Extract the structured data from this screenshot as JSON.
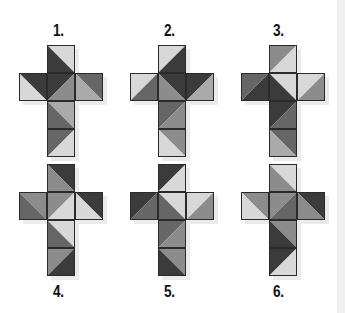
{
  "puzzle": {
    "shades": {
      "L": "#d8d8d8",
      "ML": "#aaaaaa",
      "M": "#8c8c8c",
      "MD": "#666666",
      "D": "#3b3b3b"
    },
    "nets": [
      {
        "label": "1.",
        "cells": [
          {
            "pos": "top",
            "diag": "tl-br",
            "a": "L",
            "b": "D"
          },
          {
            "pos": "left",
            "diag": "tl-br",
            "a": "D",
            "b": "L"
          },
          {
            "pos": "center",
            "diag": "bl-tr",
            "a": "D",
            "b": "M"
          },
          {
            "pos": "right",
            "diag": "tl-br",
            "a": "MD",
            "b": "ML"
          },
          {
            "pos": "below1",
            "diag": "tl-br",
            "a": "ML",
            "b": "MD"
          },
          {
            "pos": "below2",
            "diag": "bl-tr",
            "a": "MD",
            "b": "L"
          }
        ]
      },
      {
        "label": "2.",
        "cells": [
          {
            "pos": "top",
            "diag": "bl-tr",
            "a": "L",
            "b": "D"
          },
          {
            "pos": "left",
            "diag": "bl-tr",
            "a": "L",
            "b": "MD"
          },
          {
            "pos": "center",
            "diag": "tl-br",
            "a": "D",
            "b": "M"
          },
          {
            "pos": "right",
            "diag": "bl-tr",
            "a": "D",
            "b": "ML"
          },
          {
            "pos": "below1",
            "diag": "bl-tr",
            "a": "MD",
            "b": "M"
          },
          {
            "pos": "below2",
            "diag": "tl-br",
            "a": "M",
            "b": "L"
          }
        ]
      },
      {
        "label": "3.",
        "cells": [
          {
            "pos": "top",
            "diag": "bl-tr",
            "a": "M",
            "b": "L"
          },
          {
            "pos": "left",
            "diag": "bl-tr",
            "a": "MD",
            "b": "D"
          },
          {
            "pos": "center",
            "diag": "tl-br",
            "a": "L",
            "b": "D"
          },
          {
            "pos": "right",
            "diag": "bl-tr",
            "a": "L",
            "b": "M"
          },
          {
            "pos": "below1",
            "diag": "bl-tr",
            "a": "D",
            "b": "MD"
          },
          {
            "pos": "below2",
            "diag": "tl-br",
            "a": "MD",
            "b": "ML"
          }
        ]
      },
      {
        "label": "4.",
        "cells": [
          {
            "pos": "top",
            "diag": "tl-br",
            "a": "D",
            "b": "M"
          },
          {
            "pos": "left",
            "diag": "tl-br",
            "a": "M",
            "b": "MD"
          },
          {
            "pos": "center",
            "diag": "bl-tr",
            "a": "M",
            "b": "L"
          },
          {
            "pos": "right",
            "diag": "tl-br",
            "a": "D",
            "b": "L"
          },
          {
            "pos": "below1",
            "diag": "tl-br",
            "a": "L",
            "b": "MD"
          },
          {
            "pos": "below2",
            "diag": "bl-tr",
            "a": "M",
            "b": "D"
          }
        ]
      },
      {
        "label": "5.",
        "cells": [
          {
            "pos": "top",
            "diag": "bl-tr",
            "a": "D",
            "b": "L"
          },
          {
            "pos": "left",
            "diag": "bl-tr",
            "a": "D",
            "b": "MD"
          },
          {
            "pos": "center",
            "diag": "tl-br",
            "a": "L",
            "b": "MD"
          },
          {
            "pos": "right",
            "diag": "bl-tr",
            "a": "L",
            "b": "M"
          },
          {
            "pos": "below1",
            "diag": "bl-tr",
            "a": "MD",
            "b": "M"
          },
          {
            "pos": "below2",
            "diag": "tl-br",
            "a": "M",
            "b": "D"
          }
        ]
      },
      {
        "label": "6.",
        "cells": [
          {
            "pos": "top",
            "diag": "tl-br",
            "a": "L",
            "b": "M"
          },
          {
            "pos": "left",
            "diag": "tl-br",
            "a": "M",
            "b": "L"
          },
          {
            "pos": "center",
            "diag": "bl-tr",
            "a": "M",
            "b": "MD"
          },
          {
            "pos": "right",
            "diag": "tl-br",
            "a": "D",
            "b": "M"
          },
          {
            "pos": "below1",
            "diag": "tl-br",
            "a": "M",
            "b": "D"
          },
          {
            "pos": "below2",
            "diag": "bl-tr",
            "a": "D",
            "b": "L"
          }
        ]
      }
    ]
  }
}
